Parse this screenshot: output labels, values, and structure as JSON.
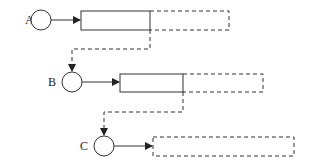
{
  "diagram": {
    "type": "pipeline-timeline",
    "stroke_color": "#333333",
    "stages": [
      {
        "label": "A",
        "circle": {
          "cx": 41,
          "cy": 20,
          "r": 10
        },
        "label_pos": {
          "x": 25,
          "y": 24
        },
        "solid_box": {
          "x": 81,
          "y": 11,
          "w": 69,
          "h": 19
        },
        "dashed_box": {
          "x": 150,
          "y": 11,
          "w": 79,
          "h": 19
        }
      },
      {
        "label": "B",
        "circle": {
          "cx": 72,
          "cy": 82,
          "r": 10
        },
        "label_pos": {
          "x": 48,
          "y": 86
        },
        "solid_box": {
          "x": 120,
          "y": 74,
          "w": 63,
          "h": 18
        },
        "dashed_box": {
          "x": 183,
          "y": 74,
          "w": 80,
          "h": 18
        }
      },
      {
        "label": "C",
        "circle": {
          "cx": 104,
          "cy": 146,
          "r": 10
        },
        "label_pos": {
          "x": 80,
          "y": 150
        },
        "solid_box": null,
        "dashed_box": {
          "x": 153,
          "y": 137,
          "w": 141,
          "h": 19
        }
      }
    ],
    "connectors": [
      {
        "from": "A",
        "to": "B",
        "style": "dashed",
        "path": "M150,30 L150,49 L72,49 L72,70"
      },
      {
        "from": "B",
        "to": "C",
        "style": "dashed",
        "path": "M183,92 L183,112 L104,112 L104,134"
      }
    ]
  }
}
